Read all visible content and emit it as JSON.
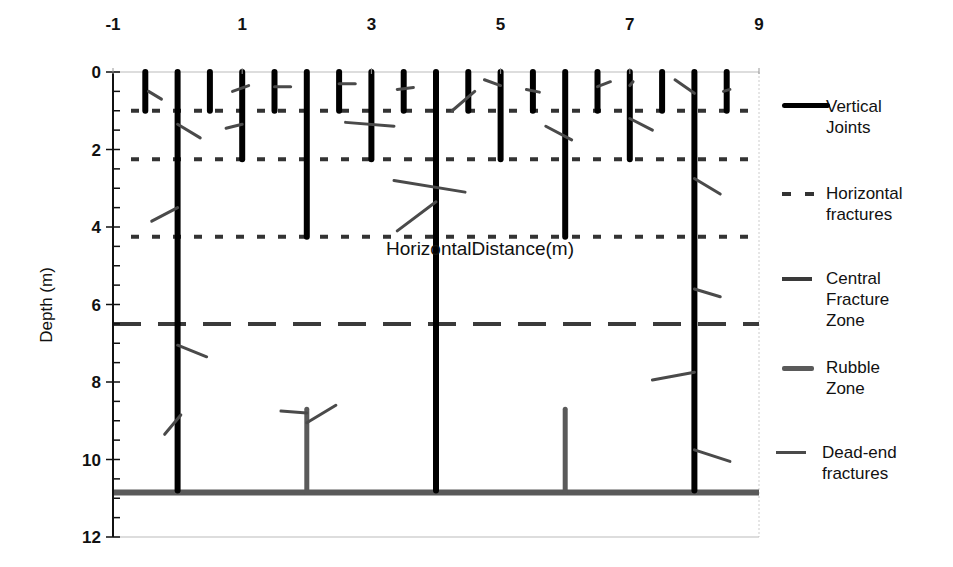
{
  "chart_data": {
    "type": "line",
    "title": "",
    "xlabel": "HorizontalDistance(m)",
    "ylabel": "Depth (m)",
    "xlim": [
      -1,
      9
    ],
    "ylim": [
      12,
      0
    ],
    "x_ticks": [
      "-1",
      "1",
      "3",
      "5",
      "7",
      "9"
    ],
    "y_ticks": [
      "0",
      "2",
      "4",
      "6",
      "8",
      "10",
      "12"
    ],
    "grid": false,
    "legend_position": "right",
    "series": [
      {
        "name": "Vertical Joints",
        "style": "solid-thick",
        "color": "#000000",
        "segments": [
          {
            "x": -0.5,
            "top": 0,
            "bottom": 1
          },
          {
            "x": 0,
            "top": 0,
            "bottom": 10.8
          },
          {
            "x": 0.5,
            "top": 0,
            "bottom": 1
          },
          {
            "x": 1,
            "top": 0,
            "bottom": 2.25
          },
          {
            "x": 1.5,
            "top": 0,
            "bottom": 1
          },
          {
            "x": 2,
            "top": 0,
            "bottom": 4.25
          },
          {
            "x": 2.5,
            "top": 0,
            "bottom": 1
          },
          {
            "x": 3,
            "top": 0,
            "bottom": 2.25
          },
          {
            "x": 3.5,
            "top": 0,
            "bottom": 1
          },
          {
            "x": 4,
            "top": 0,
            "bottom": 10.8
          },
          {
            "x": 4.5,
            "top": 0,
            "bottom": 1
          },
          {
            "x": 5,
            "top": 0,
            "bottom": 2.25
          },
          {
            "x": 5.5,
            "top": 0,
            "bottom": 1
          },
          {
            "x": 6,
            "top": 0,
            "bottom": 4.25
          },
          {
            "x": 6.5,
            "top": 0,
            "bottom": 1
          },
          {
            "x": 7,
            "top": 0,
            "bottom": 2.25
          },
          {
            "x": 7.5,
            "top": 0,
            "bottom": 1
          },
          {
            "x": 8,
            "top": 0,
            "bottom": 10.8
          },
          {
            "x": 8.5,
            "top": 0,
            "bottom": 1
          }
        ]
      },
      {
        "name": "Horizontal fractures",
        "style": "dotted",
        "color": "#333333",
        "depths": [
          1,
          2.25,
          4.25
        ]
      },
      {
        "name": "Central Fracture Zone",
        "style": "dashed",
        "color": "#3a3a3a",
        "depths": [
          6.5
        ]
      },
      {
        "name": "Rubble Zone",
        "style": "solid-gray-thick",
        "color": "#5a5a5a",
        "horizontal": {
          "depth": 10.85,
          "x_from": -1,
          "x_to": 9
        },
        "verticals": [
          {
            "x": 2,
            "top": 8.7,
            "bottom": 10.85
          },
          {
            "x": 6,
            "top": 8.7,
            "bottom": 10.85
          }
        ]
      },
      {
        "name": "Dead-end fractures",
        "style": "solid-gray-thin",
        "color": "#4a4a4a",
        "segments": [
          {
            "x1": -0.45,
            "y1": 0.5,
            "x2": -0.25,
            "y2": 0.7
          },
          {
            "x1": 0,
            "y1": 1.35,
            "x2": 0.35,
            "y2": 1.7
          },
          {
            "x1": -0.4,
            "y1": 3.85,
            "x2": 0,
            "y2": 3.5
          },
          {
            "x1": 0.85,
            "y1": 0.5,
            "x2": 1.1,
            "y2": 0.35
          },
          {
            "x1": 0.75,
            "y1": 1.45,
            "x2": 1,
            "y2": 1.35
          },
          {
            "x1": 1.5,
            "y1": 0.38,
            "x2": 1.75,
            "y2": 0.38
          },
          {
            "x1": 2.5,
            "y1": 0.3,
            "x2": 2.75,
            "y2": 0.3
          },
          {
            "x1": 2.6,
            "y1": 1.3,
            "x2": 3.35,
            "y2": 1.4
          },
          {
            "x1": 3.4,
            "y1": 0.45,
            "x2": 3.65,
            "y2": 0.4
          },
          {
            "x1": 3.35,
            "y1": 2.8,
            "x2": 4.45,
            "y2": 3.1
          },
          {
            "x1": 3.4,
            "y1": 4.1,
            "x2": 4,
            "y2": 3.35
          },
          {
            "x1": 4.25,
            "y1": 1,
            "x2": 4.6,
            "y2": 0.5
          },
          {
            "x1": 4.75,
            "y1": 0.2,
            "x2": 5,
            "y2": 0.35
          },
          {
            "x1": 5.4,
            "y1": 0.45,
            "x2": 5.6,
            "y2": 0.52
          },
          {
            "x1": 5.7,
            "y1": 1.4,
            "x2": 6.1,
            "y2": 1.75
          },
          {
            "x1": 6.5,
            "y1": 0.38,
            "x2": 6.7,
            "y2": 0.25
          },
          {
            "x1": 7,
            "y1": 0.35,
            "x2": 7.05,
            "y2": 0.25
          },
          {
            "x1": 7,
            "y1": 1.2,
            "x2": 7.35,
            "y2": 1.5
          },
          {
            "x1": 7.7,
            "y1": 0.2,
            "x2": 8,
            "y2": 0.55
          },
          {
            "x1": 8.45,
            "y1": 0.5,
            "x2": 8.55,
            "y2": 0.45
          },
          {
            "x1": 8,
            "y1": 2.75,
            "x2": 8.4,
            "y2": 3.15
          },
          {
            "x1": 8,
            "y1": 5.6,
            "x2": 8.4,
            "y2": 5.8
          },
          {
            "x1": 0,
            "y1": 7.05,
            "x2": 0.45,
            "y2": 7.35
          },
          {
            "x1": 7.35,
            "y1": 7.95,
            "x2": 8,
            "y2": 7.75
          },
          {
            "x1": -0.2,
            "y1": 9.35,
            "x2": 0.05,
            "y2": 8.85
          },
          {
            "x1": 1.6,
            "y1": 8.75,
            "x2": 2,
            "y2": 8.8
          },
          {
            "x1": 2,
            "y1": 9.05,
            "x2": 2.45,
            "y2": 8.6
          },
          {
            "x1": 8,
            "y1": 9.75,
            "x2": 8.55,
            "y2": 10.05
          }
        ]
      }
    ]
  },
  "legend": {
    "items": [
      {
        "label": "Vertical\nJoints"
      },
      {
        "label": "Horizontal\nfractures"
      },
      {
        "label": "Central\nFracture\nZone"
      },
      {
        "label": "Rubble\nZone"
      },
      {
        "label": "Dead-end\nfractures"
      }
    ]
  }
}
